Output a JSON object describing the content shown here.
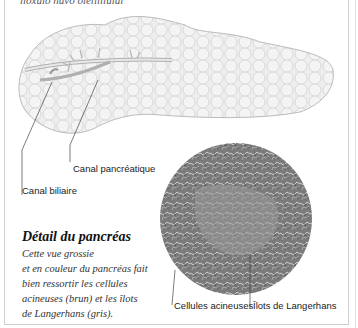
{
  "header": {
    "cut_text": "lioxuio nuvo oiéiiiiiuiui"
  },
  "labels": {
    "canal_pancreatique": "Canal pancréatique",
    "canal_biliaire": "Canal biliaire",
    "cellules_acineuses": "Cellules acineuses",
    "ilots_langerhans": "Îlots de Langerhans"
  },
  "detail": {
    "title": "Détail du pancréas",
    "lines": [
      "Cette vue grossie",
      "et en couleur du pancréas fait",
      "bien ressortir les cellules",
      "acineuses (brun) et les îlots",
      "de Langerhans (gris)."
    ]
  },
  "colors": {
    "line": "#444444",
    "tissue_light": "#e6e6e6",
    "tissue_dark": "#6e6e6e"
  }
}
